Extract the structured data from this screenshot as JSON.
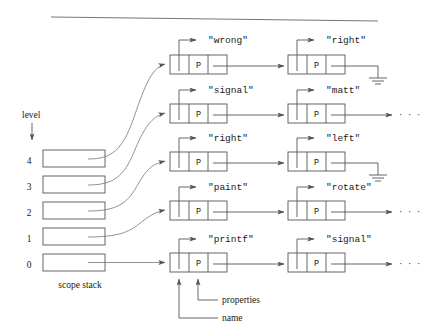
{
  "figure": {
    "title_rule": "horizontal-rule",
    "stack_caption": "scope stack",
    "level_label": "level",
    "levels": [
      "4",
      "3",
      "2",
      "1",
      "0"
    ],
    "annotations": {
      "name": "name",
      "properties": "properties"
    },
    "node_cell_middle_label": "P",
    "ellipsis": "· · ·",
    "colors": {
      "stroke": "#555555",
      "text": "#1a1a1a",
      "background": "#ffffff"
    },
    "rows": [
      {
        "level": "4",
        "nodes": [
          {
            "name": "\"wrong\"",
            "properties": "P"
          },
          {
            "name": "\"right\"",
            "properties": "P"
          }
        ],
        "terminator": "ground"
      },
      {
        "level": "3",
        "nodes": [
          {
            "name": "\"signal\"",
            "properties": "P"
          },
          {
            "name": "\"matt\"",
            "properties": "P"
          }
        ],
        "terminator": "ellipsis"
      },
      {
        "level": "2",
        "nodes": [
          {
            "name": "\"right\"",
            "properties": "P"
          },
          {
            "name": "\"left\"",
            "properties": "P"
          }
        ],
        "terminator": "ground"
      },
      {
        "level": "1",
        "nodes": [
          {
            "name": "\"paint\"",
            "properties": "P"
          },
          {
            "name": "\"rotate\"",
            "properties": "P"
          }
        ],
        "terminator": "ellipsis"
      },
      {
        "level": "0",
        "nodes": [
          {
            "name": "\"printf\"",
            "properties": "P"
          },
          {
            "name": "\"signal\"",
            "properties": "P"
          }
        ],
        "terminator": "ellipsis"
      }
    ]
  }
}
